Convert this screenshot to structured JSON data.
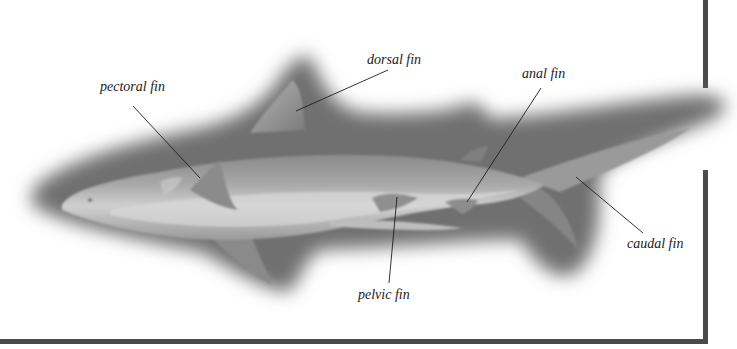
{
  "diagram": {
    "colors": {
      "background": "#ffffff",
      "frame": "#4a4a4a",
      "shadow": "#6e6e6e",
      "body_dark": "#7d7d7d",
      "body_mid": "#a3a3a3",
      "body_light": "#cdcdcd",
      "leader_line": "#1e1e1e",
      "label_text": "#222222"
    },
    "labels": [
      {
        "id": "pectoral",
        "text": "pectoral fin",
        "x": 100,
        "y": 80,
        "line": {
          "x1": 133,
          "y1": 106,
          "x2": 200,
          "y2": 178
        }
      },
      {
        "id": "dorsal",
        "text": "dorsal fin",
        "x": 367,
        "y": 53,
        "line": {
          "x1": 388,
          "y1": 70,
          "x2": 296,
          "y2": 111
        }
      },
      {
        "id": "anal",
        "text": "anal fin",
        "x": 522,
        "y": 67,
        "line": {
          "x1": 541,
          "y1": 88,
          "x2": 467,
          "y2": 202
        }
      },
      {
        "id": "pelvic",
        "text": "pelvic fin",
        "x": 358,
        "y": 288,
        "line": {
          "x1": 397,
          "y1": 197,
          "x2": 389,
          "y2": 283
        }
      },
      {
        "id": "caudal",
        "text": "caudal fin",
        "x": 627,
        "y": 237,
        "line": {
          "x1": 576,
          "y1": 177,
          "x2": 643,
          "y2": 233
        }
      }
    ]
  }
}
